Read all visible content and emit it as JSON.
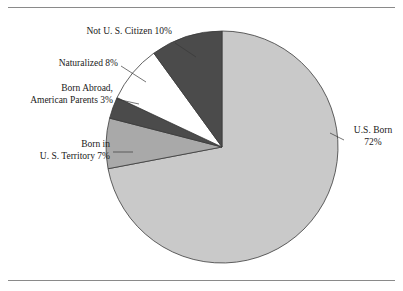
{
  "figure": {
    "background_color": "#ffffff",
    "rule_color": "#8a8a8a",
    "has_top_rule": true,
    "has_bottom_rule": true
  },
  "chart_data": {
    "type": "pie",
    "title": "",
    "subtitle": "",
    "xlabel": "",
    "ylabel": "",
    "legend_position": "none",
    "grid": false,
    "labels_placement": "outside-with-leader-lines",
    "start_angle_deg": 0,
    "direction": "clockwise",
    "categories": [
      "U.S. Born",
      "Born in U. S. Territory",
      "Born Abroad, American Parents",
      "Naturalized",
      "Not U. S. Citizen"
    ],
    "values": [
      72,
      7,
      3,
      8,
      10
    ],
    "value_suffix": "%",
    "slices": [
      {
        "name": "us-born",
        "label_line1": "U.S. Born",
        "label_line2": "72%",
        "value": 72,
        "value_text": "72%",
        "color": "#c9c9c9",
        "start_pct": 0,
        "end_pct": 72
      },
      {
        "name": "born-in-us-territory",
        "label_line1": "Born in",
        "label_line2": "U. S. Territory 7%",
        "value": 7,
        "value_text": "7%",
        "color": "#a9a9a9",
        "start_pct": 72,
        "end_pct": 79
      },
      {
        "name": "born-abroad-american-parents",
        "label_line1": "Born Abroad,",
        "label_line2": "American Parents 3%",
        "value": 3,
        "value_text": "3%",
        "color": "#4b4b4b",
        "start_pct": 79,
        "end_pct": 82
      },
      {
        "name": "naturalized",
        "label_line1": "Naturalized 8%",
        "label_line2": "",
        "value": 8,
        "value_text": "8%",
        "color": "#ffffff",
        "start_pct": 82,
        "end_pct": 90
      },
      {
        "name": "not-us-citizen",
        "label_line1": "Not U. S. Citizen 10%",
        "label_line2": "",
        "value": 10,
        "value_text": "10%",
        "color": "#4b4b4b",
        "start_pct": 90,
        "end_pct": 100
      }
    ],
    "slice_outline_color": "#3a3a3a",
    "center": {
      "x": 222,
      "y": 147
    },
    "radius": 116
  }
}
